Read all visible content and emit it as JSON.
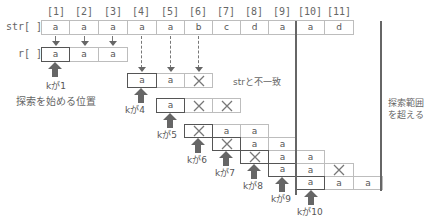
{
  "indices": [
    "[1]",
    "[2]",
    "[3]",
    "[4]",
    "[5]",
    "[6]",
    "[7]",
    "[8]",
    "[9]",
    "[10]",
    "[11]"
  ],
  "str_label": "str[ ]",
  "r_label": "r[ ]",
  "str_values": [
    "a",
    "a",
    "a",
    "a",
    "a",
    "b",
    "c",
    "d",
    "a",
    "a",
    "d"
  ],
  "r_values": [
    "a",
    "a",
    "a"
  ],
  "attempts": [
    {
      "k": "kが1",
      "cells": [
        "a",
        "a",
        "a"
      ],
      "start_col": 1
    },
    {
      "k": "kが4",
      "cells": [
        "a",
        "a",
        "✕"
      ],
      "start_col": 4
    },
    {
      "k": "kが5",
      "cells": [
        "a",
        "✕",
        "✕"
      ],
      "start_col": 5
    },
    {
      "k": "kが6",
      "cells": [
        "✕",
        "a",
        "a"
      ],
      "start_col": 6
    },
    {
      "k": "kが7",
      "cells": [
        "✕",
        "a",
        "a"
      ],
      "start_col": 7
    },
    {
      "k": "kが8",
      "cells": [
        "✕",
        "a",
        "a"
      ],
      "start_col": 8
    },
    {
      "k": "kが9",
      "cells": [
        "a",
        "a",
        "✕"
      ],
      "start_col": 9
    },
    {
      "k": "kが10",
      "cells": [
        "a",
        "a",
        "a"
      ],
      "start_col": 10
    }
  ],
  "labels": {
    "k1": "kが1",
    "k4": "kが4",
    "k5": "kが5",
    "k6": "kが6",
    "k7": "kが7",
    "k8": "kが8",
    "k9": "kが9",
    "k10": "kが10",
    "search_start": "探索を始める位置",
    "mismatch": "strと不一致",
    "out_of_range_line1": "探索範囲",
    "out_of_range_line2": "を超える"
  },
  "colors": {
    "thick_line": "#666666",
    "cell_border": "#bdbdbd",
    "start_border": "#555555",
    "arrow": "#666666"
  }
}
